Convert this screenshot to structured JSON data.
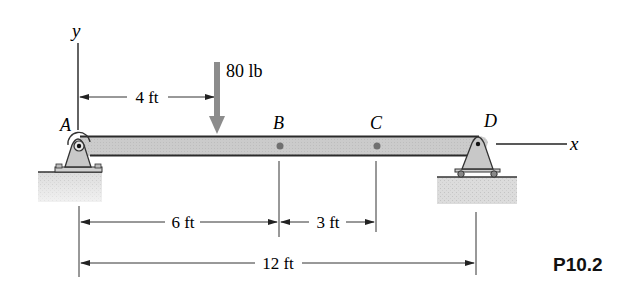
{
  "figure": {
    "id_label": "P10.2",
    "axes": {
      "x_label": "x",
      "y_label": "y"
    },
    "points": [
      {
        "name": "A",
        "x_ft": 0
      },
      {
        "name": "B",
        "x_ft": 6
      },
      {
        "name": "C",
        "x_ft": 9
      },
      {
        "name": "D",
        "x_ft": 12
      }
    ],
    "load": {
      "magnitude_label": "80 lb",
      "position_ft": 4
    },
    "dimensions": {
      "load_offset": "4 ft",
      "a_to_b": "6 ft",
      "b_to_c": "3 ft",
      "a_to_d": "12 ft"
    },
    "supports": {
      "left": "pin",
      "right": "roller"
    },
    "colors": {
      "beam_fill": "#c8c8c8",
      "beam_stroke": "#333333",
      "load_arrow": "#8c8c8c",
      "ground": "#d9d9d9",
      "point": "#707070",
      "line": "#222222"
    }
  }
}
